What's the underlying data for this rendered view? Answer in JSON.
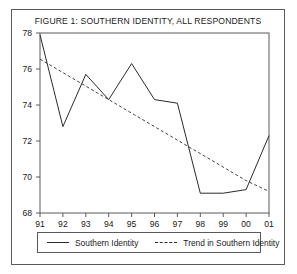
{
  "figure": {
    "title": "FIGURE 1: SOUTHERN IDENTITY, ALL RESPONDENTS"
  },
  "legend": {
    "series_label": "Southern Identity",
    "trend_label": "Trend in Southern Identity",
    "series_icon": "solid-line-icon",
    "trend_icon": "dashed-line-icon"
  },
  "colors": {
    "line": "#2b2b2b",
    "axis": "#5a5a5a",
    "frame": "#5a5a5a",
    "text": "#1a1a1a",
    "background": "#ffffff"
  },
  "chart_data": {
    "type": "line",
    "title": "FIGURE 1: SOUTHERN IDENTITY, ALL RESPONDENTS",
    "xlabel": "",
    "ylabel": "",
    "x": [
      "91",
      "92",
      "93",
      "94",
      "95",
      "96",
      "97",
      "98",
      "99",
      "00",
      "01"
    ],
    "xtick_labels": [
      "91",
      "92",
      "93",
      "94",
      "95",
      "96",
      "97",
      "98",
      "99",
      "00",
      "01"
    ],
    "ytick_labels": [
      "68",
      "70",
      "72",
      "74",
      "76",
      "78"
    ],
    "ytick_values": [
      68,
      70,
      72,
      74,
      76,
      78
    ],
    "ylim": [
      68,
      78
    ],
    "xlim": [
      0,
      10
    ],
    "grid": false,
    "legend_position": "below-axes",
    "series": [
      {
        "name": "Southern Identity",
        "style": "solid",
        "values": [
          77.9,
          72.8,
          75.7,
          74.3,
          76.3,
          74.3,
          74.1,
          69.1,
          69.1,
          69.3,
          72.3
        ]
      },
      {
        "name": "Trend in Southern Identity",
        "style": "dashed",
        "values": [
          76.55,
          75.8,
          75.05,
          74.3,
          73.55,
          72.8,
          72.05,
          71.3,
          70.55,
          69.8,
          69.2
        ]
      }
    ]
  }
}
